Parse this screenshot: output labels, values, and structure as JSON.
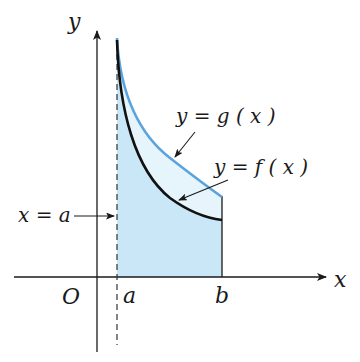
{
  "diagram": {
    "axes": {
      "x_label": "x",
      "y_label": "y",
      "origin_label": "O"
    },
    "ticks": {
      "a": "a",
      "b": "b"
    },
    "annotations": {
      "g_curve": "y = g ( x )",
      "f_curve": "y = f ( x )",
      "line_a": "x = a"
    },
    "colors": {
      "axis": "#1a1a1a",
      "f_curve": "#111111",
      "g_curve": "#5ba3dc",
      "fill_under_f": "#c9e7f6",
      "fill_between": "#e6f4fb"
    }
  }
}
